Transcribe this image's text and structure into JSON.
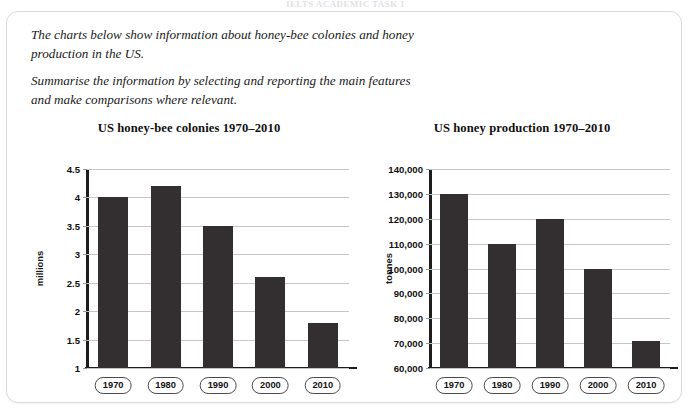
{
  "top_cut_text": "IELTS ACADEMIC TASK 1",
  "prompt": {
    "paragraph_1": "The charts below show information about honey-bee colonies and honey production in the US.",
    "paragraph_2": "Summarise the information by selecting and reporting the main features and make comparisons where relevant."
  },
  "chart_data": [
    {
      "type": "bar",
      "id": "us-honey-bee-colonies",
      "title": "US honey-bee colonies 1970–2010",
      "categories": [
        "1970",
        "1980",
        "1990",
        "2000",
        "2010"
      ],
      "values": [
        4.0,
        4.2,
        3.5,
        2.6,
        1.8
      ],
      "xlabel": "",
      "ylabel": "millions",
      "ylim": [
        1,
        4.5
      ],
      "yticks": [
        1,
        1.5,
        2,
        2.5,
        3,
        3.5,
        4,
        4.5
      ],
      "ytick_labels": [
        "1",
        "1.5",
        "2",
        "2.5",
        "3",
        "3.5",
        "4",
        "4.5"
      ],
      "grid": true,
      "legend": "none",
      "bar_color": "#332f30"
    },
    {
      "type": "bar",
      "id": "us-honey-production",
      "title": "US honey production 1970–2010",
      "categories": [
        "1970",
        "1980",
        "1990",
        "2000",
        "2010"
      ],
      "values": [
        130000,
        110000,
        120000,
        100000,
        71000
      ],
      "xlabel": "",
      "ylabel": "tonnes",
      "ylim": [
        60000,
        140000
      ],
      "yticks": [
        60000,
        70000,
        80000,
        90000,
        100000,
        110000,
        120000,
        130000,
        140000
      ],
      "ytick_labels": [
        "60,000",
        "70,000",
        "80,000",
        "90,000",
        "100,000",
        "110,000",
        "120,000",
        "130,000",
        "140,000"
      ],
      "grid": true,
      "legend": "none",
      "bar_color": "#332f30"
    }
  ]
}
